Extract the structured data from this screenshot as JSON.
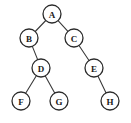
{
  "diagram": {
    "type": "binary-tree",
    "canvas": {
      "width": 131,
      "height": 123
    },
    "colors": {
      "background": "#ffffff",
      "node_fill": "#ffffff",
      "node_stroke": "#2b2b2b",
      "edge_stroke": "#3a3a3a",
      "label_color": "#1a1a1a"
    },
    "node_radius": 9,
    "nodes": [
      {
        "id": "A",
        "label": "A",
        "cx": 52,
        "cy": 14
      },
      {
        "id": "B",
        "label": "B",
        "cx": 29,
        "cy": 38
      },
      {
        "id": "C",
        "label": "C",
        "cx": 74,
        "cy": 38
      },
      {
        "id": "D",
        "label": "D",
        "cx": 41,
        "cy": 68
      },
      {
        "id": "E",
        "label": "E",
        "cx": 94,
        "cy": 68
      },
      {
        "id": "F",
        "label": "F",
        "cx": 21,
        "cy": 101
      },
      {
        "id": "G",
        "label": "G",
        "cx": 59,
        "cy": 101
      },
      {
        "id": "H",
        "label": "H",
        "cx": 110,
        "cy": 101
      }
    ],
    "edges": [
      {
        "from": "A",
        "to": "B",
        "side": "left"
      },
      {
        "from": "A",
        "to": "C",
        "side": "right"
      },
      {
        "from": "B",
        "to": "D",
        "side": "right"
      },
      {
        "from": "C",
        "to": "E",
        "side": "right"
      },
      {
        "from": "D",
        "to": "F",
        "side": "left"
      },
      {
        "from": "D",
        "to": "G",
        "side": "right"
      },
      {
        "from": "E",
        "to": "H",
        "side": "right"
      }
    ]
  }
}
